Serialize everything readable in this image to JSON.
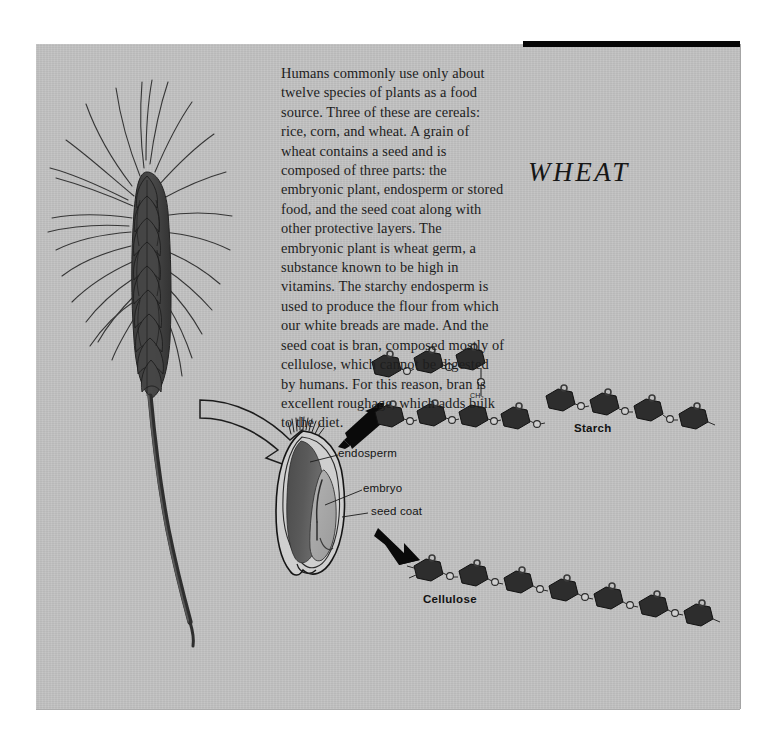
{
  "page": {
    "title": "WHEAT",
    "background_color": "#c2c2c2",
    "paper_color": "#ffffff",
    "ink_color": "#1d1d1d"
  },
  "top_rule": {
    "color": "#050505"
  },
  "body_text": "Humans commonly use only about twelve species of plants as a food source. Three of these are cereals: rice, corn, and wheat. A grain of wheat contains a seed and is composed of three parts: the embryonic plant, endosperm or stored food, and the seed coat along with other protective layers. The embryonic plant is wheat germ, a substance known to be high in vitamins. The starchy endosperm is used to produce the flour from which our white breads are made. And the seed coat is bran, composed mostly of cellulose, which cannot be digested by humans. For this reason, bran is excellent roughage, which adds bulk to the diet.",
  "illustrations": {
    "wheat_stalk": {
      "name": "wheat-stalk",
      "description": "wheat ear with awns on a curved stem"
    },
    "kernel": {
      "name": "wheat-kernel-cross-section",
      "description": "cut-away wheat grain"
    },
    "pointer_arrow": {
      "name": "outline-arrow",
      "description": "hollow arrow from stalk to kernel"
    }
  },
  "kernel_labels": [
    {
      "id": "endosperm",
      "text": "endosperm"
    },
    {
      "id": "embryo",
      "text": "embryo"
    },
    {
      "id": "seed-coat",
      "text": "seed coat"
    }
  ],
  "molecules": {
    "starch": {
      "label": "Starch",
      "branch_group": "CH",
      "branch_group_sub": "2",
      "link_atom": "O",
      "ring_count_main": 6,
      "ring_count_branch": 3,
      "branched": true
    },
    "cellulose": {
      "label": "Cellulose",
      "link_atom": "O",
      "ring_count": 7,
      "branched": false
    }
  },
  "arrows": {
    "to_starch": "solid-arrow-up-right",
    "to_cellulose": "solid-arrow-down-right"
  }
}
